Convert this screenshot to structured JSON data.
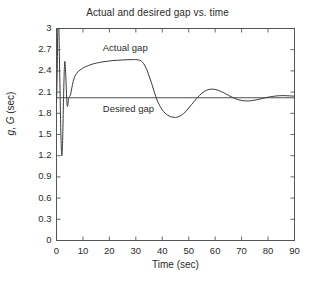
{
  "chart_data": {
    "type": "line",
    "title": "Actual and desired gap vs. time",
    "xlabel": "Time (sec)",
    "ylabel": "g, G (sec)",
    "ylabel_parts": {
      "g_italic": "g",
      "comma": ", ",
      "G_italic": "G",
      "units": " (sec)"
    },
    "xlim": [
      0,
      90
    ],
    "ylim": [
      0,
      3
    ],
    "xticks": [
      0,
      10,
      20,
      30,
      40,
      50,
      60,
      70,
      80,
      90
    ],
    "xtick_labels": [
      "0",
      "10",
      "20",
      "30",
      "40",
      "50",
      "60",
      "70",
      "80",
      "90"
    ],
    "yticks": [
      0,
      0.3,
      0.6,
      0.9,
      1.2,
      1.5,
      1.8,
      2.1,
      2.4,
      2.7,
      3
    ],
    "ytick_labels": [
      "0",
      "0.3",
      "0.6",
      "0.9",
      "1.2",
      "1.5",
      "1.8",
      "2.1",
      "2.4",
      "2.7",
      "3"
    ],
    "grid": false,
    "legend": "none",
    "line_color": "#3a3a3a",
    "axis_color": "#555555",
    "background": "#ffffff",
    "annotations": [
      {
        "text": "Actual gap",
        "x": 17.5,
        "y": 2.72
      },
      {
        "text": "Desired gap",
        "x": 17.5,
        "y": 1.86
      }
    ],
    "series": [
      {
        "name": "Actual gap",
        "clipped_at_top": true,
        "points": [
          [
            0.0,
            1.95
          ],
          [
            0.25,
            2.35
          ],
          [
            0.5,
            3.0
          ],
          [
            0.9,
            3.0
          ],
          [
            1.1,
            2.6
          ],
          [
            1.35,
            2.1
          ],
          [
            1.6,
            1.6
          ],
          [
            1.85,
            1.28
          ],
          [
            2.0,
            1.2
          ],
          [
            2.15,
            1.24
          ],
          [
            2.35,
            1.45
          ],
          [
            2.6,
            1.9
          ],
          [
            2.85,
            2.3
          ],
          [
            3.05,
            2.5
          ],
          [
            3.2,
            2.53
          ],
          [
            3.4,
            2.42
          ],
          [
            3.65,
            2.2
          ],
          [
            3.9,
            1.98
          ],
          [
            4.1,
            1.9
          ],
          [
            4.3,
            1.92
          ],
          [
            4.55,
            2.0
          ],
          [
            4.8,
            2.03
          ],
          [
            5.0,
            2.04
          ],
          [
            5.4,
            2.08
          ],
          [
            5.8,
            2.16
          ],
          [
            6.3,
            2.25
          ],
          [
            6.9,
            2.32
          ],
          [
            7.6,
            2.365
          ],
          [
            8.4,
            2.4
          ],
          [
            9.4,
            2.425
          ],
          [
            10.5,
            2.45
          ],
          [
            12.0,
            2.475
          ],
          [
            13.5,
            2.495
          ],
          [
            15.0,
            2.51
          ],
          [
            17.0,
            2.525
          ],
          [
            19.0,
            2.535
          ],
          [
            21.0,
            2.545
          ],
          [
            23.0,
            2.55
          ],
          [
            25.0,
            2.555
          ],
          [
            27.0,
            2.558
          ],
          [
            29.0,
            2.56
          ],
          [
            30.0,
            2.56
          ],
          [
            31.0,
            2.555
          ],
          [
            32.0,
            2.54
          ],
          [
            33.0,
            2.5
          ],
          [
            34.0,
            2.43
          ],
          [
            35.0,
            2.33
          ],
          [
            36.0,
            2.22
          ],
          [
            37.0,
            2.1
          ],
          [
            38.0,
            1.99
          ],
          [
            39.0,
            1.91
          ],
          [
            40.0,
            1.85
          ],
          [
            41.0,
            1.805
          ],
          [
            42.0,
            1.775
          ],
          [
            43.0,
            1.755
          ],
          [
            44.0,
            1.745
          ],
          [
            45.0,
            1.742
          ],
          [
            46.0,
            1.75
          ],
          [
            47.0,
            1.768
          ],
          [
            48.0,
            1.795
          ],
          [
            49.0,
            1.83
          ],
          [
            50.0,
            1.875
          ],
          [
            51.0,
            1.92
          ],
          [
            52.0,
            1.965
          ],
          [
            53.0,
            2.01
          ],
          [
            54.0,
            2.05
          ],
          [
            55.0,
            2.085
          ],
          [
            56.0,
            2.112
          ],
          [
            57.0,
            2.13
          ],
          [
            58.0,
            2.14
          ],
          [
            59.0,
            2.142
          ],
          [
            60.0,
            2.138
          ],
          [
            61.0,
            2.128
          ],
          [
            62.0,
            2.112
          ],
          [
            63.0,
            2.095
          ],
          [
            64.0,
            2.075
          ],
          [
            65.0,
            2.055
          ],
          [
            66.0,
            2.035
          ],
          [
            67.0,
            2.018
          ],
          [
            68.0,
            2.002
          ],
          [
            69.0,
            1.99
          ],
          [
            70.0,
            1.982
          ],
          [
            71.0,
            1.977
          ],
          [
            72.0,
            1.975
          ],
          [
            73.0,
            1.976
          ],
          [
            74.0,
            1.98
          ],
          [
            75.0,
            1.986
          ],
          [
            76.0,
            1.994
          ],
          [
            77.0,
            2.002
          ],
          [
            78.0,
            2.012
          ],
          [
            79.0,
            2.02
          ],
          [
            80.0,
            2.028
          ],
          [
            81.0,
            2.035
          ],
          [
            82.0,
            2.04
          ],
          [
            83.0,
            2.045
          ],
          [
            84.0,
            2.048
          ],
          [
            85.0,
            2.05
          ],
          [
            86.0,
            2.05
          ],
          [
            87.0,
            2.049
          ],
          [
            88.0,
            2.047
          ],
          [
            89.0,
            2.045
          ],
          [
            90.0,
            2.043
          ]
        ]
      },
      {
        "name": "Desired gap",
        "constant": 2.02,
        "points": [
          [
            0.0,
            2.02
          ],
          [
            90.0,
            2.02
          ]
        ]
      }
    ]
  }
}
